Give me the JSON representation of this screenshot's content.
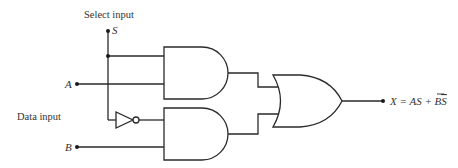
{
  "diagram": {
    "labels": {
      "select_input": "Select input",
      "data_input": "Data input",
      "s": "S",
      "a": "A",
      "b": "B",
      "output_lhs": "X = AS + B",
      "output_overbar": "S"
    },
    "components": [
      {
        "type": "AND",
        "id": "and-top",
        "inputs": [
          "S",
          "A"
        ],
        "output": "AS"
      },
      {
        "type": "NOT",
        "id": "inverter",
        "inputs": [
          "S"
        ],
        "output": "S̄"
      },
      {
        "type": "AND",
        "id": "and-bottom",
        "inputs": [
          "S̄",
          "B"
        ],
        "output": "BS̄"
      },
      {
        "type": "OR",
        "id": "or-gate",
        "inputs": [
          "AS",
          "BS̄"
        ],
        "output": "X"
      }
    ],
    "colors": {
      "line": "#2a2a2a",
      "text": "#333333",
      "background": "#ffffff"
    }
  }
}
